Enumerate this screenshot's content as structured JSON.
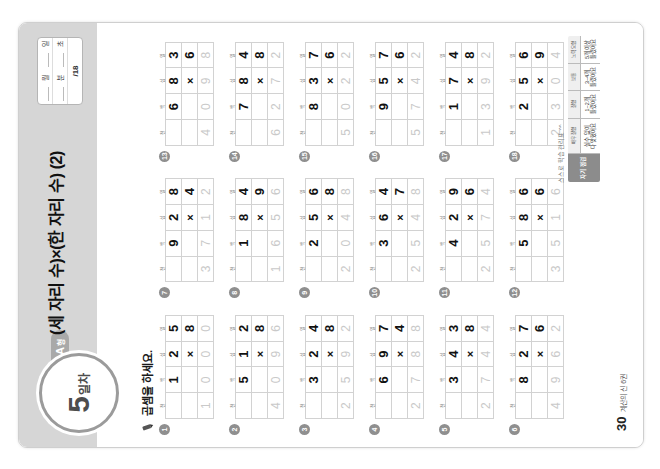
{
  "header": {
    "day_number": "5",
    "day_label": "일차",
    "type_tag": "A",
    "type_tag_small": "형",
    "title": "(세 자리 수)×(한 자리 수) (2)",
    "meta": {
      "month_label": "월",
      "day_label": "일",
      "minute_label": "분",
      "second_label": "초",
      "score": "/18"
    }
  },
  "instruction": "곱셈을 하세요.",
  "column_headers": [
    "천",
    "백",
    "십",
    "일"
  ],
  "problems": [
    {
      "num": "1",
      "multiplicand": "125",
      "multiplier": "8",
      "answer": "1000",
      "operator": "×"
    },
    {
      "num": "2",
      "multiplicand": "512",
      "multiplier": "8",
      "answer": "4096",
      "operator": "×"
    },
    {
      "num": "3",
      "multiplicand": "324",
      "multiplier": "8",
      "answer": "2592",
      "operator": "×"
    },
    {
      "num": "4",
      "multiplicand": "697",
      "multiplier": "4",
      "answer": "2788",
      "operator": "×"
    },
    {
      "num": "5",
      "multiplicand": "343",
      "multiplier": "8",
      "answer": "2744",
      "operator": "×"
    },
    {
      "num": "6",
      "multiplicand": "827",
      "multiplier": "6",
      "answer": "4962",
      "operator": "×"
    },
    {
      "num": "7",
      "multiplicand": "928",
      "multiplier": "4",
      "answer": "3712",
      "operator": "×"
    },
    {
      "num": "8",
      "multiplicand": "184",
      "multiplier": "9",
      "answer": "1656",
      "operator": "×"
    },
    {
      "num": "9",
      "multiplicand": "256",
      "multiplier": "8",
      "answer": "2048",
      "operator": "×"
    },
    {
      "num": "10",
      "multiplicand": "364",
      "multiplier": "7",
      "answer": "2548",
      "operator": "×"
    },
    {
      "num": "11",
      "multiplicand": "429",
      "multiplier": "6",
      "answer": "2574",
      "operator": "×"
    },
    {
      "num": "12",
      "multiplicand": "586",
      "multiplier": "6",
      "answer": "3516",
      "operator": "×"
    },
    {
      "num": "13",
      "multiplicand": "683",
      "multiplier": "6",
      "answer": "4098",
      "operator": "×"
    },
    {
      "num": "14",
      "multiplicand": "784",
      "multiplier": "8",
      "answer": "6272",
      "operator": "×"
    },
    {
      "num": "15",
      "multiplicand": "837",
      "multiplier": "6",
      "answer": "5022",
      "operator": "×"
    },
    {
      "num": "16",
      "multiplicand": "957",
      "multiplier": "6",
      "answer": "5742",
      "operator": "×"
    },
    {
      "num": "17",
      "multiplicand": "174",
      "multiplier": "8",
      "answer": "1392",
      "operator": "×"
    },
    {
      "num": "18",
      "multiplicand": "256",
      "multiplier": "9",
      "answer": "2304",
      "operator": "×"
    }
  ],
  "self_check": {
    "caption": "스스로 학습 관리표 ^^",
    "head": "자기 점검",
    "cells": [
      {
        "sub": "매우 잘함",
        "text": "실수 없이\n다 맞혔어요"
      },
      {
        "sub": "잘함",
        "text": "1~2개\n틀렸어요"
      },
      {
        "sub": "보통",
        "text": "3~4개\n틀렸어요"
      },
      {
        "sub": "노력 요함",
        "text": "5개 이상\n틀렸어요"
      }
    ]
  },
  "footer": {
    "page_number": "30",
    "page_text": "계산의 신 6권"
  },
  "colors": {
    "band": "#d6d6d6",
    "badge_ring": "#9b9b9b",
    "tag": "#a9a9a9",
    "answer_gray": "#c9c9c9"
  }
}
